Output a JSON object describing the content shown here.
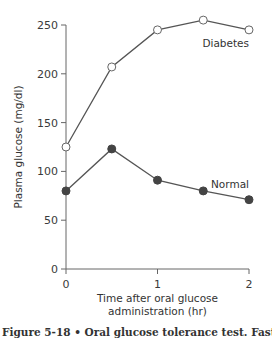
{
  "chart_data": {
    "type": "line",
    "title": "",
    "xlabel": "Time after oral glucose administration (hr)",
    "xlabel_lines": [
      "Time after oral glucose",
      "administration (hr)"
    ],
    "ylabel": "Plasma glucose (mg/dl)",
    "xlim": [
      0,
      2
    ],
    "ylim": [
      0,
      250
    ],
    "x_ticks": [
      0,
      1,
      2
    ],
    "y_ticks": [
      0,
      50,
      100,
      150,
      200,
      250
    ],
    "grid": false,
    "legend": "inline labels",
    "x": [
      0,
      0.5,
      1,
      1.5,
      2
    ],
    "series": [
      {
        "name": "Diabetes",
        "marker": "open-circle",
        "values": [
          125,
          207,
          245,
          255,
          245
        ]
      },
      {
        "name": "Normal",
        "marker": "filled-circle",
        "values": [
          80,
          123,
          91,
          80,
          71
        ]
      }
    ]
  },
  "caption": "Figure 5-18 • Oral glucose tolerance test. Fastin",
  "colors": {
    "line": "#555555",
    "filled_marker": "#444444",
    "open_marker_fill": "#ffffff"
  }
}
